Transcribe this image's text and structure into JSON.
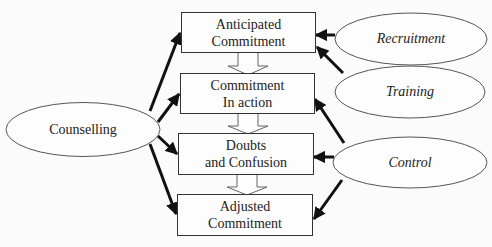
{
  "diagram": {
    "stages": [
      {
        "line1": "Anticipated",
        "line2": "Commitment"
      },
      {
        "line1": "Commitment",
        "line2": "In action"
      },
      {
        "line1": "Doubts",
        "line2": "and Confusion"
      },
      {
        "line1": "Adjusted",
        "line2": "Commitment"
      }
    ],
    "left_factor": {
      "label": "Counselling"
    },
    "right_factors": [
      {
        "label": "Recruitment"
      },
      {
        "label": "Training"
      },
      {
        "label": "Control"
      }
    ],
    "edges": [
      {
        "from": "Counselling",
        "to": "Anticipated Commitment"
      },
      {
        "from": "Counselling",
        "to": "Commitment In action"
      },
      {
        "from": "Counselling",
        "to": "Doubts and Confusion"
      },
      {
        "from": "Counselling",
        "to": "Adjusted Commitment"
      },
      {
        "from": "Recruitment",
        "to": "Anticipated Commitment"
      },
      {
        "from": "Training",
        "to": "Anticipated Commitment"
      },
      {
        "from": "Control",
        "to": "Commitment In action"
      },
      {
        "from": "Control",
        "to": "Doubts and Confusion"
      },
      {
        "from": "Control",
        "to": "Adjusted Commitment"
      },
      {
        "from": "Anticipated Commitment",
        "to": "Commitment In action",
        "style": "hollow"
      },
      {
        "from": "Commitment In action",
        "to": "Doubts and Confusion",
        "style": "hollow"
      },
      {
        "from": "Doubts and Confusion",
        "to": "Adjusted Commitment",
        "style": "hollow"
      }
    ]
  }
}
